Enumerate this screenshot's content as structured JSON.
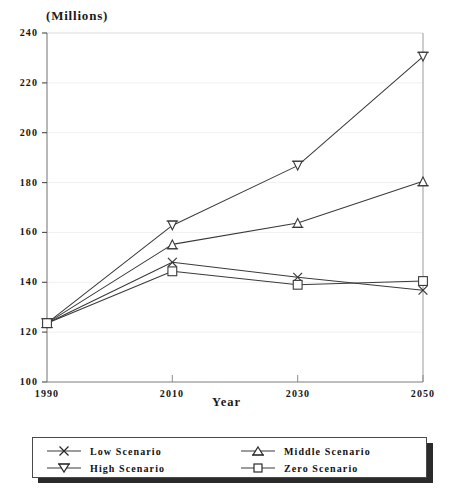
{
  "chart_data": {
    "type": "line",
    "title": "",
    "units_label": "(Millions)",
    "xlabel": "Year",
    "ylabel": "",
    "categories": [
      "1990",
      "2010",
      "2030",
      "2050"
    ],
    "x": [
      1990,
      2010,
      2030,
      2050
    ],
    "xlim": [
      1990,
      2050
    ],
    "ylim": [
      100,
      240
    ],
    "yticks": [
      100,
      120,
      140,
      160,
      180,
      200,
      220,
      240
    ],
    "ytick_labels": [
      "100",
      "120",
      "140",
      "160",
      "180",
      "200",
      "220",
      "240"
    ],
    "xticks": [
      1990,
      2010,
      2030,
      2050
    ],
    "xtick_labels": [
      "1990",
      "2010",
      "2030",
      "2050"
    ],
    "grid": true,
    "grid_axis": "y",
    "legend_position": "bottom",
    "series": [
      {
        "name": "Low Scenario",
        "marker": "x-marker",
        "color": "#3a3a3a",
        "values": [
          123.6,
          148.0,
          142.0,
          136.8
        ]
      },
      {
        "name": "High Scenario",
        "marker": "down-triangle-marker",
        "color": "#3a3a3a",
        "values": [
          123.6,
          162.8,
          186.8,
          230.5
        ]
      },
      {
        "name": "Middle Scenario",
        "marker": "up-triangle-marker",
        "color": "#3a3a3a",
        "values": [
          123.6,
          155.2,
          163.8,
          180.5
        ]
      },
      {
        "name": "Zero Scenario",
        "marker": "square-marker",
        "color": "#3a3a3a",
        "values": [
          123.6,
          144.4,
          139.0,
          140.5
        ]
      }
    ]
  },
  "legend": {
    "entries": [
      {
        "label": "Low Scenario",
        "marker": "x-marker"
      },
      {
        "label": "High Scenario",
        "marker": "down-triangle-marker"
      },
      {
        "label": "Middle Scenario",
        "marker": "up-triangle-marker"
      },
      {
        "label": "Zero Scenario",
        "marker": "square-marker"
      }
    ]
  },
  "style": {
    "axis_color": "#6b6b6b",
    "grid_color": "#efefef",
    "line_color": "#3a3a3a",
    "text_color": "#151515",
    "background": "#ffffff"
  }
}
